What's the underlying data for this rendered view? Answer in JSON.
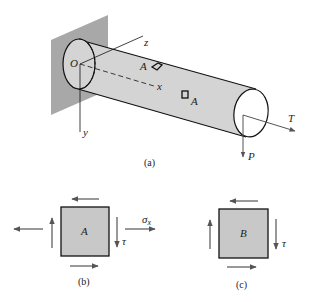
{
  "figure": {
    "panel_a": {
      "caption": "(a)",
      "labels": {
        "origin": "O",
        "z_axis": "z",
        "x_axis": "x",
        "y_axis": "y",
        "point_a": "A",
        "point_b": "B",
        "torque": "T",
        "load": "P"
      }
    },
    "panel_b": {
      "caption": "(b)",
      "element_label": "A",
      "shear_label": "τ",
      "normal_stress_label": "σ",
      "normal_stress_subscript": "x"
    },
    "panel_c": {
      "caption": "(c)",
      "element_label": "B",
      "shear_label": "τ"
    },
    "colors": {
      "wall": "#a8a8a8",
      "shaft_fill": "#d4d4d4",
      "element_fill": "#c8c8c8",
      "arrow": "#555555",
      "stroke": "#111111"
    }
  }
}
